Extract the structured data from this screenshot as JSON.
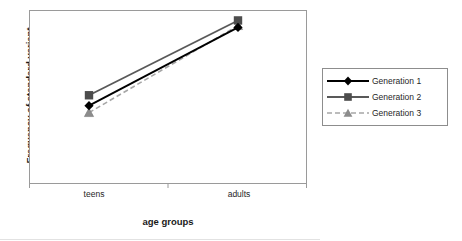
{
  "chart_data": {
    "type": "line",
    "title": "",
    "xlabel": "age groups",
    "ylabel": "Frequency of standard variant",
    "categories": [
      "teens",
      "adults"
    ],
    "x": [
      0,
      1
    ],
    "grid": false,
    "legend_position": "right",
    "ylim": [
      0,
      100
    ],
    "y_tick_labels": [],
    "x_tick_labels": [
      "teens",
      "adults"
    ],
    "series": [
      {
        "name": "Generation 1",
        "values": [
          45,
          90
        ],
        "color": "#000000",
        "line_style": "solid",
        "marker": "diamond",
        "marker_color": "#000000"
      },
      {
        "name": "Generation 2",
        "values": [
          51,
          94
        ],
        "color": "#595959",
        "line_style": "solid",
        "marker": "square",
        "marker_color": "#4d4d4d"
      },
      {
        "name": "Generation 3",
        "values": [
          41,
          91
        ],
        "color": "#a6a6a6",
        "line_style": "dashed",
        "marker": "triangle",
        "marker_color": "#8c8c8c"
      }
    ]
  },
  "axes": {
    "y_title": "Frequency of standard variant",
    "x_title": "age groups",
    "x_categories": [
      {
        "label": "teens"
      },
      {
        "label": "adults"
      }
    ]
  },
  "legend": {
    "entries": [
      {
        "label": "Generation 1"
      },
      {
        "label": "Generation 2"
      },
      {
        "label": "Generation 3"
      }
    ]
  },
  "colors": {
    "generation_1": "#000000",
    "generation_2": "#595959",
    "generation_3": "#a6a6a6",
    "plot_border": "#9a9a9a",
    "legend_border": "#8d8d8d",
    "background": "#ffffff"
  }
}
